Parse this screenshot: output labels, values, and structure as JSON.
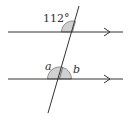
{
  "diagram": {
    "angle_labels": {
      "given": "112°",
      "a": "a",
      "b": "b"
    },
    "colors": {
      "line": "#333333",
      "angle_fill": "#d0d0d0"
    }
  }
}
